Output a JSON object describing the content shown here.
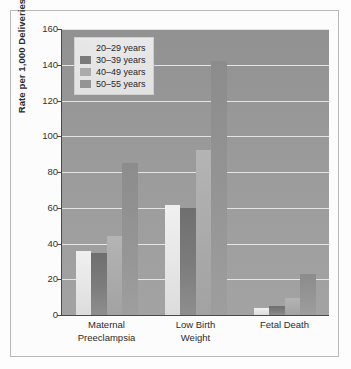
{
  "chart_data": {
    "type": "bar",
    "title": "",
    "xlabel": "",
    "ylabel": "Rate per 1,000 Deliveries",
    "ylim": [
      0,
      160
    ],
    "yticks": [
      0,
      20,
      40,
      60,
      80,
      100,
      120,
      140,
      160
    ],
    "grid": true,
    "legend_position": "upper left inside plot",
    "categories": [
      "Maternal\nPreeclampsia",
      "Low Birth\nWeight",
      "Fetal Death"
    ],
    "series": [
      {
        "name": "20–29 years",
        "color": "#e6e6e6",
        "values": [
          36,
          61.5,
          4
        ]
      },
      {
        "name": "30–39 years",
        "color": "#7b7b7b",
        "values": [
          34.5,
          60,
          5
        ]
      },
      {
        "name": "40–49 years",
        "color": "#ababab",
        "values": [
          44,
          92.5,
          9.5
        ]
      },
      {
        "name": "50–55 years",
        "color": "#949494",
        "values": [
          85,
          142,
          23
        ]
      }
    ]
  },
  "figure": {
    "plot_background": "#9a9a9a",
    "gridline_color": "#eaeaea",
    "frame_border": "#b9b9b9",
    "page_background": "#fdfdfd"
  }
}
